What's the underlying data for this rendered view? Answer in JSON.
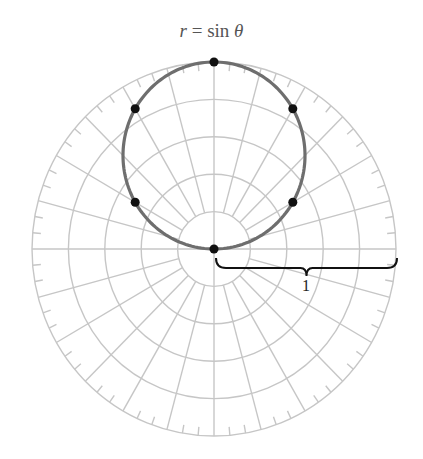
{
  "figure": {
    "title_var": "r",
    "title_rest": " = sin ",
    "title_theta": "θ",
    "scale_label": "1"
  },
  "style": {
    "grid_color": "#c6c6c6",
    "curve_color": "#6e6e6e",
    "point_color": "#111111",
    "brace_color": "#111111",
    "title_color": "#555555"
  },
  "chart_data": {
    "type": "scatter",
    "subtype": "polar",
    "title": "r = sin θ",
    "function": "r = sin(theta)",
    "theta_range_deg": [
      0,
      180
    ],
    "points": [
      {
        "theta_deg": 0,
        "r": 0
      },
      {
        "theta_deg": 30,
        "r": 0.5
      },
      {
        "theta_deg": 60,
        "r": 0.866
      },
      {
        "theta_deg": 90,
        "r": 1
      },
      {
        "theta_deg": 120,
        "r": 0.866
      },
      {
        "theta_deg": 150,
        "r": 0.5
      }
    ],
    "grid": {
      "rings": [
        0.2,
        0.4,
        0.6,
        0.8,
        1.0
      ],
      "radial_spacing_deg": 15,
      "tick_spacing_deg": 5,
      "radial_start_r": 0.2
    },
    "annotations": [
      {
        "type": "brace",
        "from_r": 0,
        "to_r": 1,
        "angle_deg": 0,
        "label": "1"
      }
    ],
    "rlim": [
      0,
      1
    ]
  }
}
